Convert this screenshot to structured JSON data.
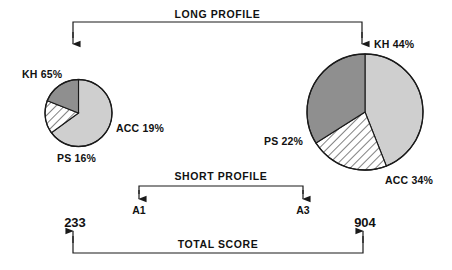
{
  "figure": {
    "background_color": "#ffffff",
    "line_color": "#1a1a1a",
    "brackets": {
      "long_profile": {
        "label": "LONG PROFILE"
      },
      "short_profile": {
        "label": "SHORT PROFILE"
      },
      "total_score": {
        "label": "TOTAL SCORE"
      }
    },
    "nodes": {
      "left_node": {
        "label": "A1"
      },
      "right_node": {
        "label": "A3"
      }
    },
    "scores": {
      "left_score": {
        "label": "233"
      },
      "right_score": {
        "label": "904"
      }
    }
  },
  "chart_data": [
    {
      "type": "pie",
      "name": "left-pie-chart",
      "title": "",
      "categories": [
        "KH",
        "PS",
        "ACC"
      ],
      "values": [
        65,
        16,
        19
      ],
      "labels": [
        "KH 65%",
        "PS 16%",
        "ACC 19%"
      ],
      "colors": [
        "#cfcfcf",
        "#ffffff",
        "#8f8f8f"
      ],
      "fills": [
        "solid",
        "hatched",
        "solid"
      ],
      "units": "percent",
      "total_score": 233,
      "node": "A1"
    },
    {
      "type": "pie",
      "name": "right-pie-chart",
      "title": "",
      "categories": [
        "KH",
        "PS",
        "ACC"
      ],
      "values": [
        44,
        22,
        34
      ],
      "labels": [
        "KH 44%",
        "PS 22%",
        "ACC 34%"
      ],
      "colors": [
        "#cfcfcf",
        "#ffffff",
        "#8f8f8f"
      ],
      "fills": [
        "solid",
        "hatched",
        "solid"
      ],
      "units": "percent",
      "total_score": 904,
      "node": "A3"
    }
  ]
}
